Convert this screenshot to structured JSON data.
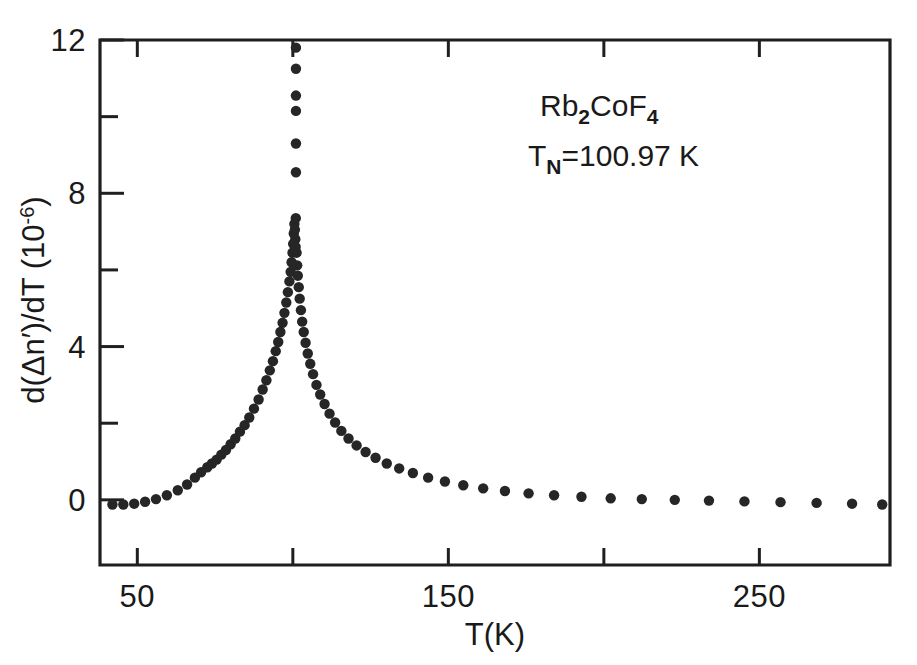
{
  "figure": {
    "background_color": "#ffffff",
    "ink_color": "#1f1f1f",
    "marker_color": "#262626"
  },
  "annotations": {
    "compound": {
      "prefix": "Rb",
      "sub1": "2",
      "mid": "CoF",
      "sub2": "4",
      "full_text": "Rb2CoF4"
    },
    "neel_temperature": {
      "symbol": "T",
      "subscript": "N",
      "equals_value": "=100.97 K",
      "full_text": "TN=100.97 K"
    }
  },
  "axes": {
    "x": {
      "label": "T(K)",
      "tick_labels": [
        "50",
        "150",
        "250"
      ],
      "tick_values": [
        50,
        150,
        250
      ],
      "minor_tick_values": [
        100,
        200
      ],
      "range": [
        38,
        292
      ]
    },
    "y": {
      "label_parts": {
        "main": "d(Δn′)/dT  (10",
        "exponent": "-6",
        "close": ")"
      },
      "label": "d(Δn′)/dT (10-6)",
      "tick_labels": [
        "0",
        "4",
        "8",
        "12"
      ],
      "tick_values": [
        0,
        4,
        8,
        12
      ],
      "minor_tick_values": [
        2,
        6,
        10
      ],
      "range": [
        -1.7,
        12.0
      ]
    }
  },
  "chart_data": {
    "type": "scatter",
    "title": "",
    "subtitle": "",
    "xlabel": "T(K)",
    "ylabel": "d(Δn′)/dT (10⁻⁶)",
    "xlim": [
      38,
      292
    ],
    "ylim": [
      -1.7,
      12.0
    ],
    "grid": false,
    "legend": null,
    "annotations": [
      "Rb2CoF4",
      "TN=100.97 K"
    ],
    "series": [
      {
        "name": "d(Δn′)/dT",
        "marker": "filled-circle",
        "color": "#262626",
        "points": [
          [
            42.0,
            -0.12
          ],
          [
            45.5,
            -0.12
          ],
          [
            49.0,
            -0.1
          ],
          [
            52.5,
            -0.05
          ],
          [
            56.0,
            0.02
          ],
          [
            59.5,
            0.12
          ],
          [
            63.0,
            0.25
          ],
          [
            66.0,
            0.4
          ],
          [
            68.5,
            0.58
          ],
          [
            70.5,
            0.72
          ],
          [
            72.5,
            0.85
          ],
          [
            74.0,
            0.95
          ],
          [
            75.5,
            1.05
          ],
          [
            77.0,
            1.18
          ],
          [
            78.5,
            1.3
          ],
          [
            80.0,
            1.45
          ],
          [
            81.5,
            1.6
          ],
          [
            83.0,
            1.78
          ],
          [
            84.5,
            1.95
          ],
          [
            86.0,
            2.15
          ],
          [
            87.5,
            2.38
          ],
          [
            89.0,
            2.62
          ],
          [
            90.3,
            2.88
          ],
          [
            91.5,
            3.12
          ],
          [
            92.6,
            3.38
          ],
          [
            93.6,
            3.62
          ],
          [
            94.5,
            3.88
          ],
          [
            95.3,
            4.12
          ],
          [
            96.0,
            4.38
          ],
          [
            96.7,
            4.62
          ],
          [
            97.3,
            4.88
          ],
          [
            97.9,
            5.15
          ],
          [
            98.4,
            5.42
          ],
          [
            98.9,
            5.7
          ],
          [
            99.3,
            5.95
          ],
          [
            99.6,
            6.2
          ],
          [
            99.9,
            6.45
          ],
          [
            100.1,
            6.68
          ],
          [
            100.3,
            6.95
          ],
          [
            100.5,
            7.2
          ],
          [
            100.65,
            7.05
          ],
          [
            100.8,
            6.8
          ],
          [
            100.9,
            6.6
          ],
          [
            100.95,
            7.35
          ],
          [
            101.0,
            8.55
          ],
          [
            101.0,
            9.3
          ],
          [
            101.0,
            10.15
          ],
          [
            101.0,
            10.55
          ],
          [
            101.0,
            11.25
          ],
          [
            101.0,
            11.8
          ],
          [
            101.2,
            6.45
          ],
          [
            101.4,
            6.12
          ],
          [
            101.6,
            5.85
          ],
          [
            101.9,
            5.55
          ],
          [
            102.2,
            5.25
          ],
          [
            102.6,
            4.95
          ],
          [
            103.0,
            4.65
          ],
          [
            103.5,
            4.38
          ],
          [
            104.1,
            4.1
          ],
          [
            104.8,
            3.82
          ],
          [
            105.6,
            3.55
          ],
          [
            106.5,
            3.28
          ],
          [
            107.6,
            3.0
          ],
          [
            108.8,
            2.75
          ],
          [
            110.2,
            2.5
          ],
          [
            111.8,
            2.25
          ],
          [
            113.6,
            2.02
          ],
          [
            115.6,
            1.8
          ],
          [
            117.9,
            1.6
          ],
          [
            120.5,
            1.42
          ],
          [
            123.4,
            1.25
          ],
          [
            126.6,
            1.1
          ],
          [
            130.2,
            0.95
          ],
          [
            134.2,
            0.82
          ],
          [
            138.6,
            0.7
          ],
          [
            143.5,
            0.58
          ],
          [
            148.9,
            0.48
          ],
          [
            154.8,
            0.38
          ],
          [
            161.2,
            0.3
          ],
          [
            168.2,
            0.23
          ],
          [
            175.8,
            0.17
          ],
          [
            184.0,
            0.12
          ],
          [
            192.8,
            0.08
          ],
          [
            202.2,
            0.04
          ],
          [
            212.2,
            0.02
          ],
          [
            222.8,
            0.0
          ],
          [
            233.8,
            -0.02
          ],
          [
            245.2,
            -0.04
          ],
          [
            256.8,
            -0.06
          ],
          [
            268.4,
            -0.08
          ],
          [
            279.8,
            -0.1
          ],
          [
            289.5,
            -0.12
          ]
        ]
      }
    ]
  }
}
